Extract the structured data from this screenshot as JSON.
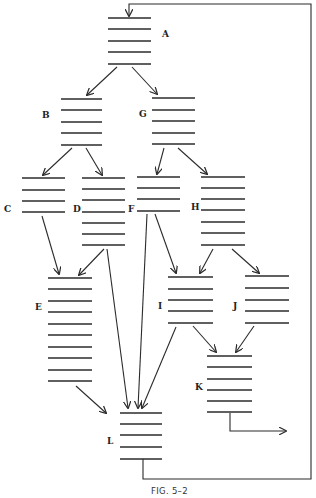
{
  "caption": "FIG. 5–2",
  "colors": {
    "ink": "#2b2b2b",
    "background": "#ffffff"
  },
  "blocks": [
    {
      "id": "A",
      "label": "A",
      "x1": 108,
      "x2": 151,
      "lines": [
        18,
        29,
        41,
        52,
        64
      ],
      "label_x": 162,
      "label_y": 37
    },
    {
      "id": "B",
      "label": "B",
      "x1": 61,
      "x2": 102,
      "lines": [
        99,
        110,
        122,
        133,
        145
      ],
      "label_x": 42,
      "label_y": 118
    },
    {
      "id": "G",
      "label": "G",
      "x1": 152,
      "x2": 195,
      "lines": [
        98,
        110,
        121,
        133,
        144
      ],
      "label_x": 139,
      "label_y": 117
    },
    {
      "id": "C",
      "label": "C",
      "x1": 22,
      "x2": 65,
      "lines": [
        178,
        190,
        201,
        212
      ],
      "label_x": 4,
      "label_y": 212
    },
    {
      "id": "D",
      "label": "D",
      "x1": 82,
      "x2": 125,
      "lines": [
        178,
        189,
        200,
        212,
        223,
        234,
        245
      ],
      "label_x": 73,
      "label_y": 212
    },
    {
      "id": "F",
      "label": "F",
      "x1": 137,
      "x2": 180,
      "lines": [
        177,
        188,
        199,
        211
      ],
      "label_x": 128,
      "label_y": 212
    },
    {
      "id": "H",
      "label": "H",
      "x1": 201,
      "x2": 245,
      "lines": [
        177,
        188,
        199,
        210,
        222,
        233,
        245
      ],
      "label_x": 191,
      "label_y": 210
    },
    {
      "id": "E",
      "label": "E",
      "x1": 48,
      "x2": 92,
      "lines": [
        278,
        289,
        301,
        312,
        324,
        335,
        347,
        358,
        370,
        381
      ],
      "label_x": 35,
      "label_y": 310
    },
    {
      "id": "I",
      "label": "I",
      "x1": 168,
      "x2": 213,
      "lines": [
        277,
        289,
        300,
        311,
        323
      ],
      "label_x": 158,
      "label_y": 309
    },
    {
      "id": "J",
      "label": "J",
      "x1": 245,
      "x2": 289,
      "lines": [
        276,
        288,
        300,
        311,
        323
      ],
      "label_x": 233,
      "label_y": 309
    },
    {
      "id": "K",
      "label": "K",
      "x1": 207,
      "x2": 252,
      "lines": [
        356,
        367,
        379,
        390,
        401,
        412
      ],
      "label_x": 195,
      "label_y": 390
    },
    {
      "id": "L",
      "label": "L",
      "x1": 120,
      "x2": 162,
      "lines": [
        413,
        424,
        435,
        447,
        459
      ],
      "label_x": 107,
      "label_y": 444
    }
  ],
  "edges": [
    {
      "from": "A",
      "to": "B",
      "x1": 117,
      "y1": 67,
      "x2": 87,
      "y2": 95
    },
    {
      "from": "A",
      "to": "G",
      "x1": 132,
      "y1": 67,
      "x2": 157,
      "y2": 94
    },
    {
      "from": "B",
      "to": "C",
      "x1": 72,
      "y1": 148,
      "x2": 43,
      "y2": 175
    },
    {
      "from": "B",
      "to": "D",
      "x1": 86,
      "y1": 148,
      "x2": 102,
      "y2": 175
    },
    {
      "from": "G",
      "to": "F",
      "x1": 164,
      "y1": 148,
      "x2": 157,
      "y2": 174
    },
    {
      "from": "G",
      "to": "H",
      "x1": 178,
      "y1": 148,
      "x2": 207,
      "y2": 174
    },
    {
      "from": "C",
      "to": "E",
      "x1": 42,
      "y1": 216,
      "x2": 59,
      "y2": 274
    },
    {
      "from": "D",
      "to": "E",
      "x1": 104,
      "y1": 249,
      "x2": 79,
      "y2": 275
    },
    {
      "from": "D",
      "to": "L",
      "x1": 107,
      "y1": 249,
      "x2": 128,
      "y2": 408
    },
    {
      "from": "F",
      "to": "L",
      "x1": 147,
      "y1": 214,
      "x2": 138,
      "y2": 408
    },
    {
      "from": "F",
      "to": "I",
      "x1": 155,
      "y1": 214,
      "x2": 176,
      "y2": 273
    },
    {
      "from": "H",
      "to": "I",
      "x1": 213,
      "y1": 249,
      "x2": 200,
      "y2": 273
    },
    {
      "from": "H",
      "to": "J",
      "x1": 232,
      "y1": 249,
      "x2": 259,
      "y2": 273
    },
    {
      "from": "E",
      "to": "L",
      "x1": 76,
      "y1": 386,
      "x2": 106,
      "y2": 413
    },
    {
      "from": "I",
      "to": "L",
      "x1": 176,
      "y1": 327,
      "x2": 142,
      "y2": 408
    },
    {
      "from": "I",
      "to": "K",
      "x1": 193,
      "y1": 326,
      "x2": 216,
      "y2": 352
    },
    {
      "from": "J",
      "to": "K",
      "x1": 254,
      "y1": 326,
      "x2": 236,
      "y2": 352
    }
  ],
  "loop_path": "M143 459 L143 479 L311 479 L311 4 L129 4 L129 16",
  "exit_path": "M230 413 L230 431 L286 431"
}
